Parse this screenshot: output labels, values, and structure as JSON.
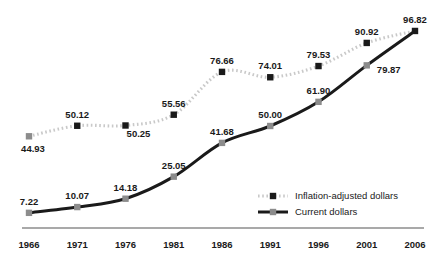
{
  "chart_data": {
    "type": "line",
    "title": "",
    "subtitle": "",
    "xlabel": "",
    "ylabel": "",
    "grid": false,
    "legend_position": "inside-bottom-right",
    "x": [
      1966,
      1971,
      1976,
      1981,
      1986,
      1991,
      1996,
      2001,
      2006
    ],
    "categories": [
      "1966",
      "1971",
      "1976",
      "1981",
      "1986",
      "1991",
      "1996",
      "2001",
      "2006"
    ],
    "xlim": [
      1966,
      2006
    ],
    "ylim": [
      0,
      100
    ],
    "series": [
      {
        "name": "Inflation-adjusted dollars",
        "line_style": "dotted",
        "line_color": "#c9c9c9",
        "marker_color": "#1a1a1a",
        "marker": "square",
        "values": [
          44.93,
          50.12,
          50.25,
          55.56,
          76.66,
          74.01,
          79.53,
          90.92,
          96.82
        ],
        "labels": [
          "44.93",
          "50.12",
          "50.25",
          "55.56",
          "76.66",
          "74.01",
          "79.53",
          "90.92",
          "96.82"
        ]
      },
      {
        "name": "Current dollars",
        "line_style": "solid",
        "line_color": "#1a1a1a",
        "marker_color": "#8c8c8c",
        "marker": "square",
        "values": [
          7.22,
          10.07,
          14.18,
          25.05,
          41.68,
          50.0,
          61.9,
          79.87,
          96.82
        ],
        "labels": [
          "7.22",
          "10.07",
          "14.18",
          "25.05",
          "41.68",
          "50.00",
          "61.90",
          "79.87",
          "96.82"
        ]
      }
    ]
  },
  "legend": {
    "entries": [
      {
        "label": "Inflation-adjusted dollars",
        "style": "dotted",
        "swatch_color": "#1a1a1a",
        "line_color": "#c9c9c9"
      },
      {
        "label": "Current dollars",
        "style": "solid",
        "swatch_color": "#8c8c8c",
        "line_color": "#1a1a1a"
      }
    ]
  },
  "axis": {
    "baseline_color": "#8c8c8c",
    "ticks": [
      "1966",
      "1971",
      "1976",
      "1981",
      "1986",
      "1991",
      "1996",
      "2001",
      "2006"
    ]
  },
  "colors": {
    "text": "#1a1a1a",
    "dotted_line": "#c9c9c9",
    "solid_line": "#1a1a1a",
    "gray_marker": "#8c8c8c",
    "black_marker": "#1a1a1a",
    "background": "#ffffff"
  }
}
